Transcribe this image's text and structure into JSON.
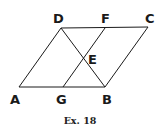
{
  "diagram": {
    "type": "geometry",
    "points": {
      "A": {
        "x": 19,
        "y": 87
      },
      "G": {
        "x": 63,
        "y": 87
      },
      "B": {
        "x": 105,
        "y": 87
      },
      "D": {
        "x": 61,
        "y": 28
      },
      "F": {
        "x": 105,
        "y": 28
      },
      "C": {
        "x": 148,
        "y": 27
      },
      "E": {
        "x": 84,
        "y": 58
      }
    },
    "segments": [
      [
        "A",
        "B"
      ],
      [
        "D",
        "C"
      ],
      [
        "A",
        "D"
      ],
      [
        "B",
        "C"
      ],
      [
        "D",
        "B"
      ],
      [
        "G",
        "F"
      ]
    ],
    "labels": {
      "A": "A",
      "B": "B",
      "C": "C",
      "D": "D",
      "E": "E",
      "F": "F",
      "G": "G"
    },
    "caption": "Ex. 18",
    "colors": {
      "line": "#1a1a1a",
      "background": "#ffffff"
    }
  }
}
